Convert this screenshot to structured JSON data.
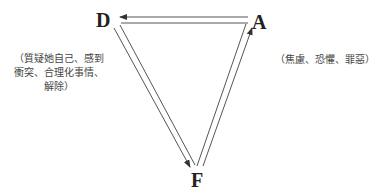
{
  "diagram": {
    "nodes": [
      {
        "id": "D",
        "label": "D"
      },
      {
        "id": "A",
        "label": "A"
      },
      {
        "id": "F",
        "label": "F"
      }
    ],
    "edges": [
      {
        "from": "A",
        "to": "D",
        "style": "double-line",
        "arrow_at": "D"
      },
      {
        "from": "D",
        "to": "F",
        "style": "double-line",
        "arrow_at": "F"
      },
      {
        "from": "F",
        "to": "A",
        "style": "double-line",
        "arrow_at": "A"
      }
    ],
    "notes": {
      "D": {
        "line1": "（質疑她自己、感到",
        "line2": "衝突、合理化事情、",
        "line3": "解除）"
      },
      "A": {
        "line1": "（焦慮、恐懼、罪惡）"
      }
    },
    "colors": {
      "line": "#555555",
      "text": "#222222",
      "note_text": "#444444",
      "background": "#ffffff"
    }
  }
}
